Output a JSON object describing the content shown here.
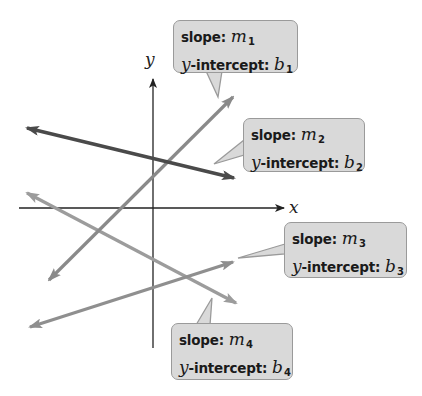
{
  "figure": {
    "axes": {
      "x_label": "x",
      "y_label": "y",
      "origin_px": [
        153,
        208
      ],
      "x_axis_px": {
        "start": 19,
        "end": 284
      },
      "y_axis_px": {
        "start": 78,
        "end": 348
      },
      "axis_color": "#222222"
    },
    "lines": [
      {
        "id": "line-1",
        "color": "#8a8a8a",
        "from_px": [
          49,
          280
        ],
        "to_px": [
          233,
          97
        ],
        "direction": "increasing"
      },
      {
        "id": "line-2",
        "color": "#4a4a4a",
        "from_px": [
          27,
          128
        ],
        "to_px": [
          234,
          178
        ],
        "direction": "decreasing"
      },
      {
        "id": "line-3",
        "color": "#8f8f8f",
        "from_px": [
          30,
          327
        ],
        "to_px": [
          233,
          262
        ],
        "direction": "increasing"
      },
      {
        "id": "line-4",
        "color": "#9c9c9c",
        "from_px": [
          27,
          193
        ],
        "to_px": [
          236,
          303
        ],
        "direction": "decreasing"
      }
    ],
    "callouts": [
      {
        "slope_label": "slope:",
        "slope_var": "m",
        "slope_sub": "1",
        "intercept_prefix": "y",
        "intercept_label": "-intercept:",
        "intercept_var": "b",
        "intercept_sub": "1"
      },
      {
        "slope_label": "slope:",
        "slope_var": "m",
        "slope_sub": "2",
        "intercept_prefix": "y",
        "intercept_label": "-intercept:",
        "intercept_var": "b",
        "intercept_sub": "2"
      },
      {
        "slope_label": "slope:",
        "slope_var": "m",
        "slope_sub": "3",
        "intercept_prefix": "y",
        "intercept_label": "-intercept:",
        "intercept_var": "b",
        "intercept_sub": "3"
      },
      {
        "slope_label": "slope:",
        "slope_var": "m",
        "slope_sub": "4",
        "intercept_prefix": "y",
        "intercept_label": "-intercept:",
        "intercept_var": "b",
        "intercept_sub": "4"
      }
    ],
    "colors": {
      "callout_fill": "#d9d9d9",
      "callout_border": "#9a9a9a",
      "background": "#ffffff"
    }
  }
}
